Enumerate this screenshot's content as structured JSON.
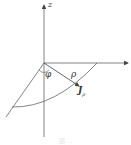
{
  "diagram": {
    "axes": {
      "z_label": "z"
    },
    "labels": {
      "phi": "φ",
      "rho": "ρ",
      "J_main": "J",
      "J_sub": "ρ"
    },
    "caption": "图 …",
    "colors": {
      "line": "#555555",
      "background": "#ffffff"
    }
  }
}
